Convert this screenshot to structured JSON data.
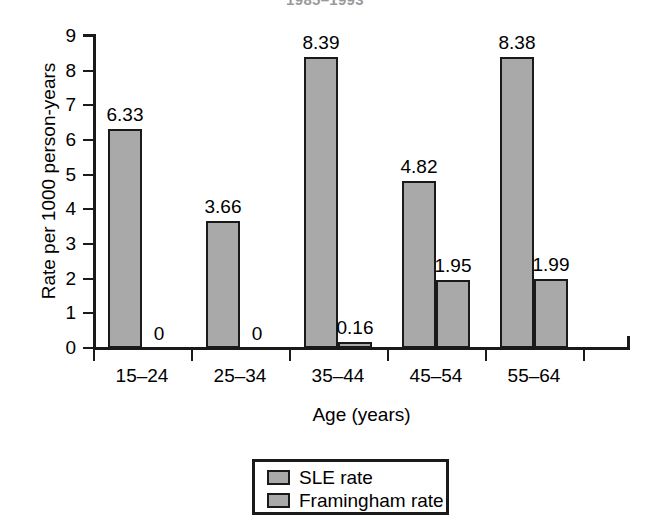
{
  "chart_data": {
    "type": "bar",
    "title": "1985–1993",
    "title_note": "cropped at top edge of image",
    "xlabel": "Age (years)",
    "ylabel": "Rate per 1000 person-years",
    "categories": [
      "15–24",
      "25–34",
      "35–44",
      "45–54",
      "55–64"
    ],
    "series": [
      {
        "name": "SLE rate",
        "values": [
          6.33,
          3.66,
          8.39,
          4.82,
          8.38
        ],
        "labels": [
          "6.33",
          "3.66",
          "8.39",
          "4.82",
          "8.38"
        ],
        "color": "#a9a9a9"
      },
      {
        "name": "Framingham rate",
        "values": [
          0,
          0,
          0.16,
          1.95,
          1.99
        ],
        "labels": [
          "0",
          "0",
          "0.16",
          "1.95",
          "1.99"
        ],
        "color": "#a9a9a9"
      }
    ],
    "ylim": [
      0,
      9
    ],
    "yticks": [
      0,
      1,
      2,
      3,
      4,
      5,
      6,
      7,
      8,
      9
    ],
    "ytick_labels": [
      "0",
      "1",
      "2",
      "3",
      "4",
      "5",
      "6",
      "7",
      "8",
      "9"
    ],
    "grid": false,
    "legend_position": "bottom-center",
    "legend_entries": [
      "SLE rate",
      "Framingham rate"
    ]
  },
  "axis": {
    "line_color": "#1a1a1a"
  }
}
